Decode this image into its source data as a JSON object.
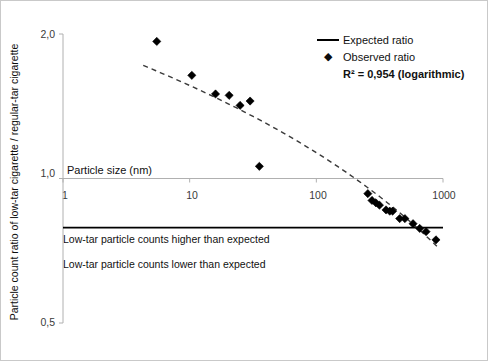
{
  "chart_data": {
    "type": "scatter",
    "title": "",
    "xlabel": "Particle size (nm)",
    "ylabel": "Particle count ratio of low-tar cigarette / regular-tar cigarette",
    "xscale": "log",
    "yscale": "log",
    "xlim": [
      1,
      1000
    ],
    "ylim": [
      0.5,
      2.0
    ],
    "xticks": [
      "1",
      "10",
      "100",
      "1000"
    ],
    "xtick_values": [
      1,
      10,
      100,
      1000
    ],
    "yticks": [
      "2,0",
      "1,0",
      "0,5"
    ],
    "ytick_values": [
      2.0,
      1.0,
      0.5
    ],
    "grid": false,
    "legend_position": "top-right",
    "legend": [
      {
        "label": "Expected ratio",
        "marker": "line"
      },
      {
        "label": "Observed ratio",
        "marker": "diamond"
      }
    ],
    "r_squared_text": "R² = 0,954 (logarithmic)",
    "r_squared_value": 0.954,
    "fit_type": "logarithmic",
    "series": [
      {
        "name": "Observed ratio",
        "marker": "diamond",
        "color": "#000000",
        "points": [
          {
            "x": 5.5,
            "y": 1.93
          },
          {
            "x": 10.4,
            "y": 1.64
          },
          {
            "x": 16.0,
            "y": 1.5
          },
          {
            "x": 20.5,
            "y": 1.49
          },
          {
            "x": 25.0,
            "y": 1.42
          },
          {
            "x": 30.0,
            "y": 1.45
          },
          {
            "x": 35.5,
            "y": 1.06
          },
          {
            "x": 255,
            "y": 0.93
          },
          {
            "x": 275,
            "y": 0.9
          },
          {
            "x": 295,
            "y": 0.89
          },
          {
            "x": 315,
            "y": 0.88
          },
          {
            "x": 355,
            "y": 0.86
          },
          {
            "x": 380,
            "y": 0.855
          },
          {
            "x": 400,
            "y": 0.855
          },
          {
            "x": 455,
            "y": 0.825
          },
          {
            "x": 500,
            "y": 0.825
          },
          {
            "x": 580,
            "y": 0.805
          },
          {
            "x": 655,
            "y": 0.787
          },
          {
            "x": 735,
            "y": 0.775
          },
          {
            "x": 880,
            "y": 0.745
          }
        ]
      },
      {
        "name": "Expected ratio",
        "marker": "line",
        "color": "#000000",
        "constant_y": 0.79
      }
    ],
    "trendline": {
      "name": "Logarithmic fit",
      "style": "dashed",
      "color": "#3a3a3a",
      "x_start": 4.3,
      "x_end": 930,
      "y_start": 1.72,
      "y_end": 0.715
    },
    "annotations": [
      {
        "text": "Low-tar particle counts higher than expected",
        "y": 0.83
      },
      {
        "text": "Low-tar particle counts lower than expected",
        "y": 0.755
      }
    ]
  }
}
